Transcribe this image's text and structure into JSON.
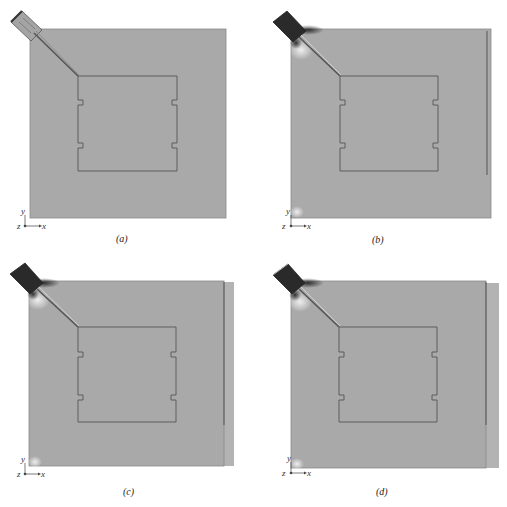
{
  "figure": {
    "panels": [
      {
        "id": "a",
        "caption": "(a)",
        "axis": {
          "y": "y",
          "z": "z",
          "x": "x"
        },
        "variant": "no-strip",
        "feed": "unexcited"
      },
      {
        "id": "b",
        "caption": "(b)",
        "axis": {
          "y": "y",
          "z": "z",
          "x": "x"
        },
        "variant": "strip-inside-plate",
        "feed": "excited"
      },
      {
        "id": "c",
        "caption": "(c)",
        "axis": {
          "y": "y",
          "z": "z",
          "x": "x"
        },
        "variant": "strip-with-extended-ground",
        "feed": "excited"
      },
      {
        "id": "d",
        "caption": "(d)",
        "axis": {
          "y": "y",
          "z": "z",
          "x": "x"
        },
        "variant": "strip-with-extended-ground",
        "feed": "excited"
      }
    ],
    "colors": {
      "plate": "#a9a9a9",
      "plate_extension": "#b3b3b3",
      "outline": "#555555",
      "feed_dark": "#2a2a2a",
      "highlight": "#e8e8e8",
      "background": "#ffffff"
    }
  }
}
